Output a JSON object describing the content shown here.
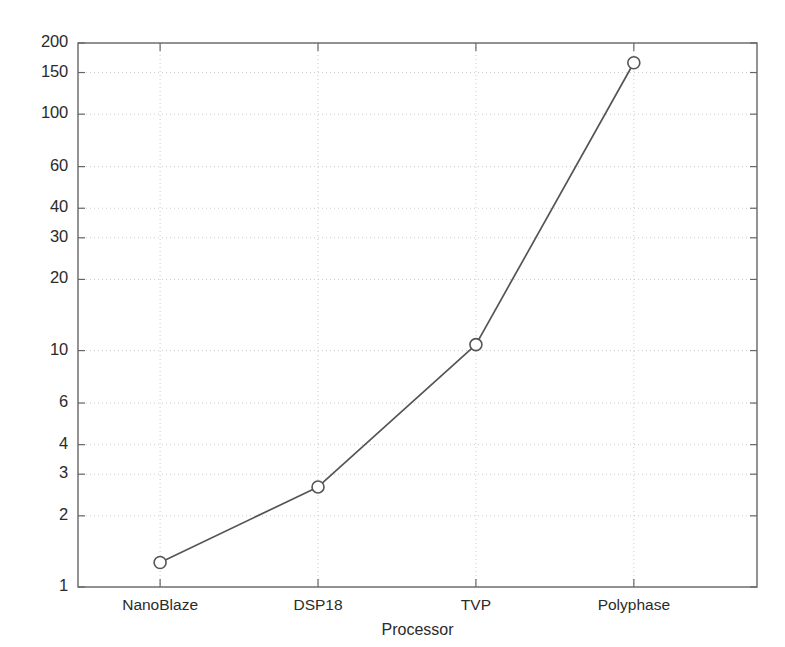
{
  "chart_data": {
    "type": "line",
    "title": "",
    "xlabel": "Processor",
    "ylabel": "MSPS",
    "categories": [
      "NanoBlaze",
      "DSP18",
      "TVP",
      "Polyphase"
    ],
    "values": [
      1.27,
      2.65,
      10.6,
      165
    ],
    "series": [
      {
        "name": "MSPS",
        "values": [
          1.27,
          2.65,
          10.6,
          165
        ],
        "marker": "circle",
        "line_color": "#555555",
        "marker_color": "#555555"
      }
    ],
    "yscale": "log",
    "ylim": [
      1,
      200
    ],
    "ytick_values": [
      1,
      2,
      3,
      4,
      6,
      10,
      20,
      30,
      40,
      60,
      100,
      150,
      200
    ],
    "ytick_labels": [
      "1",
      "2",
      "3",
      "4",
      "6",
      "10",
      "20",
      "30",
      "40",
      "60",
      "100",
      "150",
      "200"
    ],
    "xtick_labels": [
      "NanoBlaze",
      "DSP18",
      "TVP",
      "Polyphase"
    ],
    "grid": true,
    "grid_style": "dotted",
    "grid_color": "#cccccc",
    "legend": "none",
    "axes_color": "#666666",
    "background": "#ffffff"
  },
  "figure": {
    "plot_left": 78,
    "plot_right": 757,
    "plot_top": 43,
    "plot_bottom": 587
  }
}
